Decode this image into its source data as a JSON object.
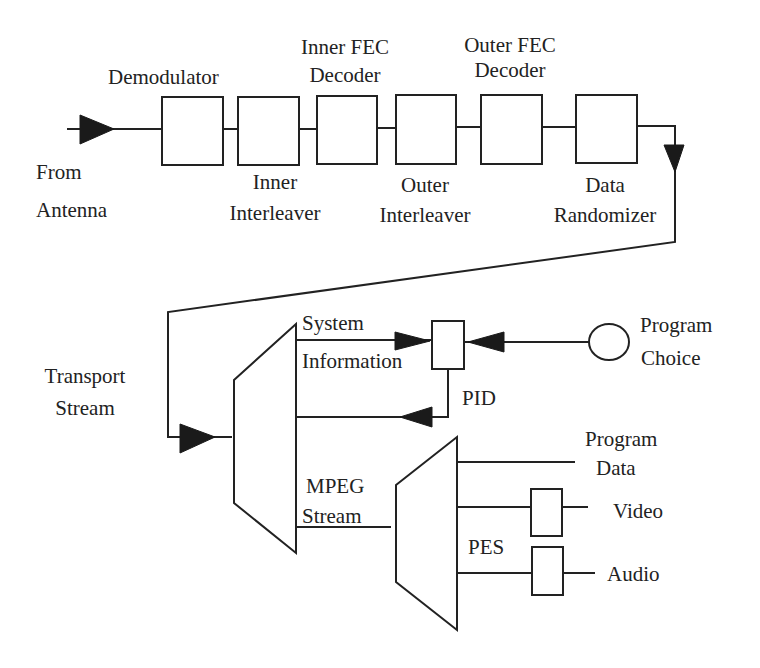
{
  "diagram": {
    "top_chain": {
      "input_label": [
        "From",
        "Antenna"
      ],
      "blocks": [
        {
          "id": "demodulator",
          "label": [
            "Demodulator"
          ],
          "label_position": "above"
        },
        {
          "id": "inner-interleaver",
          "label": [
            "Inner",
            "Interleaver"
          ],
          "label_position": "below"
        },
        {
          "id": "inner-fec-decoder",
          "label": [
            "Inner FEC",
            "Decoder"
          ],
          "label_position": "above"
        },
        {
          "id": "outer-interleaver",
          "label": [
            "Outer",
            "Interleaver"
          ],
          "label_position": "below"
        },
        {
          "id": "outer-fec-decoder",
          "label": [
            "Outer FEC",
            "Decoder"
          ],
          "label_position": "above"
        },
        {
          "id": "data-randomizer",
          "label": [
            "Data",
            "Randomizer"
          ],
          "label_position": "below"
        }
      ]
    },
    "transport_stream_label": [
      "Transport",
      "Stream"
    ],
    "demux1": {
      "outputs": {
        "system_information": [
          "System",
          "Information"
        ],
        "mpeg_stream": [
          "MPEG",
          "Stream"
        ]
      }
    },
    "pid_block": {
      "label": "PID"
    },
    "program_choice": {
      "label": [
        "Program",
        "Choice"
      ]
    },
    "demux2": {
      "label": "PES",
      "outputs": [
        {
          "id": "program-data",
          "label": [
            "Program",
            "Data"
          ]
        },
        {
          "id": "video",
          "label": [
            "Video"
          ]
        },
        {
          "id": "audio",
          "label": [
            "Audio"
          ]
        }
      ]
    }
  }
}
